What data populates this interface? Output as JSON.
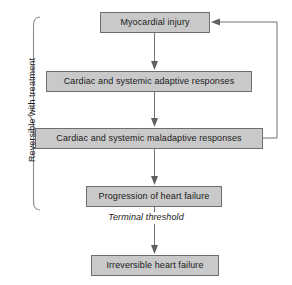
{
  "diagram": {
    "type": "flowchart",
    "nodes": [
      {
        "id": "myocardial_injury",
        "label": "Myocardial injury"
      },
      {
        "id": "adaptive",
        "label": "Cardiac and systemic adaptive responses"
      },
      {
        "id": "maladaptive",
        "label": "Cardiac and systemic maladaptive responses"
      },
      {
        "id": "progression",
        "label": "Progression of heart failure"
      },
      {
        "id": "irreversible",
        "label": "Irreversible heart failure"
      }
    ],
    "annotations": {
      "terminal_threshold": "Terminal threshold",
      "bracket_label": "Reversible with treatment"
    },
    "colors": {
      "node_fill": "#c9c9c9",
      "node_border": "#6e6e6e",
      "connector": "#707070",
      "brace": "#8a8a8a",
      "text": "#1a1a1a",
      "background": "#ffffff"
    },
    "edges": [
      {
        "from": "myocardial_injury",
        "to": "adaptive",
        "style": "arrow-down"
      },
      {
        "from": "adaptive",
        "to": "maladaptive",
        "style": "arrow-down"
      },
      {
        "from": "maladaptive",
        "to": "progression",
        "style": "arrow-down"
      },
      {
        "from": "progression",
        "to": "irreversible",
        "style": "arrow-down-through-label"
      },
      {
        "from": "maladaptive",
        "to": "myocardial_injury",
        "style": "feedback-loop-right"
      }
    ]
  }
}
